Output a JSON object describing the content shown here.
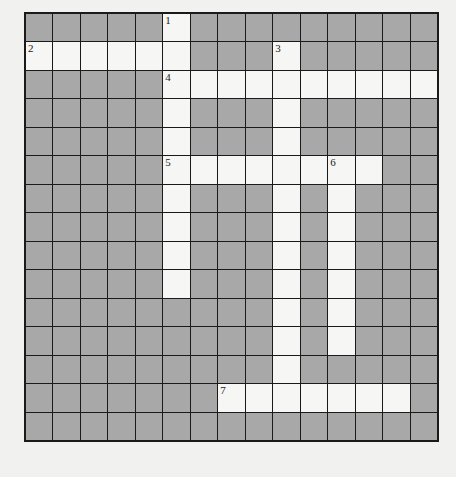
{
  "puzzle": {
    "rows": 15,
    "cols": 15,
    "colors": {
      "block": "#a8a8a8",
      "open": "#f6f6f4",
      "line": "#1a1a1a",
      "page": "#f1f1ef"
    },
    "entries": [
      {
        "number": "1",
        "direction": "down",
        "row": 0,
        "col": 5,
        "length": 10
      },
      {
        "number": "2",
        "direction": "across",
        "row": 1,
        "col": 0,
        "length": 6
      },
      {
        "number": "3",
        "direction": "down",
        "row": 1,
        "col": 9,
        "length": 13
      },
      {
        "number": "4",
        "direction": "across",
        "row": 2,
        "col": 5,
        "length": 10
      },
      {
        "number": "5",
        "direction": "across",
        "row": 5,
        "col": 5,
        "length": 8
      },
      {
        "number": "6",
        "direction": "down",
        "row": 5,
        "col": 11,
        "length": 7
      },
      {
        "number": "7",
        "direction": "across",
        "row": 13,
        "col": 7,
        "length": 7
      }
    ]
  }
}
